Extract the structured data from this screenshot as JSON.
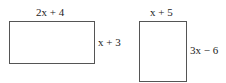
{
  "figure": {
    "shapes": [
      {
        "id": "rect-left",
        "type": "rectangle",
        "width_label": "2x + 4",
        "height_label": "x + 3"
      },
      {
        "id": "rect-right",
        "type": "rectangle",
        "width_label": "x + 5",
        "height_label": "3x − 6"
      }
    ]
  }
}
